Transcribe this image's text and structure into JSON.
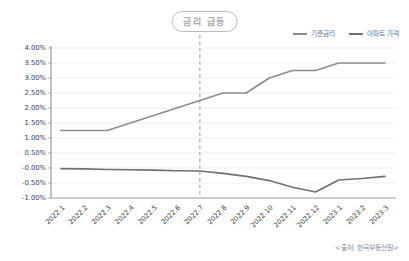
{
  "chart_data": {
    "type": "line",
    "title": "금리 급등",
    "categories": [
      "2022.1",
      "2022.2",
      "2022.3",
      "2022.4",
      "2022.5",
      "2022.6",
      "2022.7",
      "2022.8",
      "2022.9",
      "2022.10",
      "2022.11",
      "2022.12",
      "2023.1",
      "2023.2",
      "2023.3"
    ],
    "series": [
      {
        "name": "기준금리",
        "color": "#8c8c8c",
        "values": [
          1.25,
          1.25,
          1.25,
          1.5,
          1.75,
          2.0,
          2.25,
          2.5,
          2.5,
          3.0,
          3.25,
          3.25,
          3.5,
          3.5,
          3.5
        ]
      },
      {
        "name": "아파트 가격",
        "color": "#707070",
        "values": [
          -0.02,
          -0.03,
          -0.05,
          -0.06,
          -0.07,
          -0.09,
          -0.1,
          -0.18,
          -0.28,
          -0.42,
          -0.64,
          -0.8,
          -0.4,
          -0.35,
          -0.28
        ]
      }
    ],
    "ylim": [
      -1.0,
      4.0
    ],
    "ytick_step": 0.5,
    "ytick_labels": [
      "4.00%",
      "3.50%",
      "3.00%",
      "2.50%",
      "2.00%",
      "1.50%",
      "1.00%",
      "0.50%",
      "-0.00%",
      "-0.50%",
      "-1.00%"
    ],
    "xlabel": "",
    "ylabel": "",
    "grid": true,
    "legend_position": "top-right",
    "annotation": {
      "label": "금리 급등",
      "at_category": "2022.7"
    },
    "colors": {
      "grid": "#ececec",
      "axis": "#9a9a9a",
      "tick_text": "#3d3d3d",
      "dashed": "#a9a9a9"
    }
  },
  "source_note": "<출처: 한국부동산원>"
}
